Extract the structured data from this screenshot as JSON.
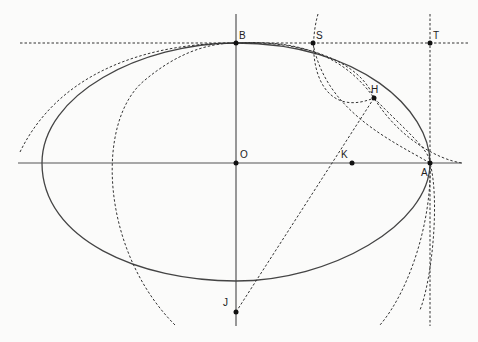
{
  "diagram": {
    "title": "",
    "points": [
      {
        "id": "B",
        "label": "B"
      },
      {
        "id": "S",
        "label": "S"
      },
      {
        "id": "T",
        "label": "T"
      },
      {
        "id": "H",
        "label": "H"
      },
      {
        "id": "O",
        "label": "O"
      },
      {
        "id": "K",
        "label": "K"
      },
      {
        "id": "A",
        "label": "A"
      },
      {
        "id": "J",
        "label": "J"
      }
    ],
    "curves": {
      "ellipse": "solid closed curve through A and B",
      "axes": "horizontal axis OA and vertical axis OB",
      "construction": "dashed tangent lines through B and A, dashed circles through B, S, H, A; dashed segment J–H through K"
    }
  }
}
